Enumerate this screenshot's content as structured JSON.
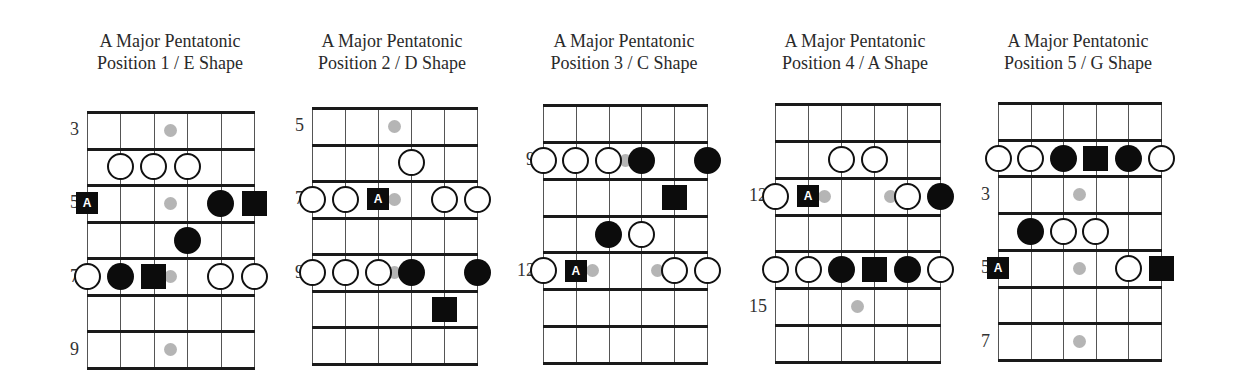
{
  "diagrams": [
    {
      "title_line1": "A Major Pentatonic",
      "title_line2": "Position 1 / E Shape",
      "title_center_x": 170,
      "grid": {
        "left": 87,
        "top": 112,
        "right": 254,
        "bottom": 368
      },
      "fret_labels": [
        {
          "row": 0,
          "label": "3"
        },
        {
          "row": 2,
          "label": "5"
        },
        {
          "row": 4,
          "label": "7"
        },
        {
          "row": 6,
          "label": "9"
        }
      ],
      "markers": [
        {
          "row": 0,
          "string": 2.5,
          "type": "inlay"
        },
        {
          "row": 1,
          "string": 1,
          "type": "open"
        },
        {
          "row": 1,
          "string": 2,
          "type": "open"
        },
        {
          "row": 1,
          "string": 3,
          "type": "open"
        },
        {
          "row": 2,
          "string": 2.5,
          "type": "inlay"
        },
        {
          "row": 2,
          "string": 0,
          "type": "root",
          "label": "A"
        },
        {
          "row": 2,
          "string": 4,
          "type": "filled"
        },
        {
          "row": 2,
          "string": 5,
          "type": "square"
        },
        {
          "row": 3,
          "string": 3,
          "type": "filled"
        },
        {
          "row": 4,
          "string": 2.5,
          "type": "inlay"
        },
        {
          "row": 4,
          "string": 0,
          "type": "open"
        },
        {
          "row": 4,
          "string": 1,
          "type": "filled"
        },
        {
          "row": 4,
          "string": 2,
          "type": "square"
        },
        {
          "row": 4,
          "string": 4,
          "type": "open"
        },
        {
          "row": 4,
          "string": 5,
          "type": "open"
        },
        {
          "row": 6,
          "string": 2.5,
          "type": "inlay"
        }
      ]
    },
    {
      "title_line1": "A Major Pentatonic",
      "title_line2": "Position 2 / D Shape",
      "title_center_x": 392,
      "grid": {
        "left": 312,
        "top": 108,
        "right": 477,
        "bottom": 364
      },
      "fret_labels": [
        {
          "row": 0,
          "label": "5"
        },
        {
          "row": 2,
          "label": "7"
        },
        {
          "row": 4,
          "label": "9"
        }
      ],
      "markers": [
        {
          "row": 0,
          "string": 2.5,
          "type": "inlay"
        },
        {
          "row": 1,
          "string": 3,
          "type": "open"
        },
        {
          "row": 2,
          "string": 2.5,
          "type": "inlay"
        },
        {
          "row": 2,
          "string": 0,
          "type": "open"
        },
        {
          "row": 2,
          "string": 1,
          "type": "open"
        },
        {
          "row": 2,
          "string": 2,
          "type": "root",
          "label": "A"
        },
        {
          "row": 2,
          "string": 4,
          "type": "open"
        },
        {
          "row": 2,
          "string": 5,
          "type": "open"
        },
        {
          "row": 4,
          "string": 2.5,
          "type": "inlay"
        },
        {
          "row": 4,
          "string": 0,
          "type": "open"
        },
        {
          "row": 4,
          "string": 1,
          "type": "open"
        },
        {
          "row": 4,
          "string": 2,
          "type": "open"
        },
        {
          "row": 4,
          "string": 3,
          "type": "filled"
        },
        {
          "row": 4,
          "string": 5,
          "type": "filled"
        },
        {
          "row": 5,
          "string": 4,
          "type": "square"
        }
      ]
    },
    {
      "title_line1": "A Major Pentatonic",
      "title_line2": "Position 3 / C Shape",
      "title_center_x": 624,
      "grid": {
        "left": 543,
        "top": 105,
        "right": 707,
        "bottom": 363
      },
      "fret_labels": [
        {
          "row": 1,
          "label": "9"
        },
        {
          "row": 4,
          "label": "12"
        }
      ],
      "markers": [
        {
          "row": 1,
          "string": 2.5,
          "type": "inlay"
        },
        {
          "row": 1,
          "string": 0,
          "type": "open"
        },
        {
          "row": 1,
          "string": 1,
          "type": "open"
        },
        {
          "row": 1,
          "string": 2,
          "type": "open"
        },
        {
          "row": 1,
          "string": 3,
          "type": "filled"
        },
        {
          "row": 1,
          "string": 5,
          "type": "filled"
        },
        {
          "row": 2,
          "string": 4,
          "type": "square"
        },
        {
          "row": 3,
          "string": 2,
          "type": "filled"
        },
        {
          "row": 3,
          "string": 3,
          "type": "open"
        },
        {
          "row": 4,
          "string": 1.5,
          "type": "inlay"
        },
        {
          "row": 4,
          "string": 3.5,
          "type": "inlay"
        },
        {
          "row": 4,
          "string": 0,
          "type": "open"
        },
        {
          "row": 4,
          "string": 1,
          "type": "root",
          "label": "A"
        },
        {
          "row": 4,
          "string": 4,
          "type": "open"
        },
        {
          "row": 4,
          "string": 5,
          "type": "open"
        }
      ]
    },
    {
      "title_line1": "A Major Pentatonic",
      "title_line2": "Position 4 / A Shape",
      "title_center_x": 855,
      "grid": {
        "left": 775,
        "top": 104,
        "right": 940,
        "bottom": 362
      },
      "fret_labels": [
        {
          "row": 2,
          "label": "12"
        },
        {
          "row": 5,
          "label": "15"
        }
      ],
      "markers": [
        {
          "row": 1,
          "string": 2,
          "type": "open"
        },
        {
          "row": 1,
          "string": 3,
          "type": "open"
        },
        {
          "row": 2,
          "string": 1.5,
          "type": "inlay"
        },
        {
          "row": 2,
          "string": 3.5,
          "type": "inlay"
        },
        {
          "row": 2,
          "string": 0,
          "type": "open"
        },
        {
          "row": 2,
          "string": 1,
          "type": "root",
          "label": "A"
        },
        {
          "row": 2,
          "string": 4,
          "type": "open"
        },
        {
          "row": 2,
          "string": 5,
          "type": "filled"
        },
        {
          "row": 4,
          "string": 0,
          "type": "open"
        },
        {
          "row": 4,
          "string": 1,
          "type": "open"
        },
        {
          "row": 4,
          "string": 2,
          "type": "filled"
        },
        {
          "row": 4,
          "string": 3,
          "type": "square"
        },
        {
          "row": 4,
          "string": 4,
          "type": "filled"
        },
        {
          "row": 4,
          "string": 5,
          "type": "open"
        },
        {
          "row": 5,
          "string": 2.5,
          "type": "inlay"
        }
      ]
    },
    {
      "title_line1": "A Major Pentatonic",
      "title_line2": "Position 5 / G Shape",
      "title_center_x": 1078,
      "grid": {
        "left": 998,
        "top": 103,
        "right": 1161,
        "bottom": 360
      },
      "fret_labels": [
        {
          "row": 2,
          "label": "3"
        },
        {
          "row": 4,
          "label": "5"
        },
        {
          "row": 6,
          "label": "7"
        }
      ],
      "markers": [
        {
          "row": 1,
          "string": 0,
          "type": "open"
        },
        {
          "row": 1,
          "string": 1,
          "type": "open"
        },
        {
          "row": 1,
          "string": 2,
          "type": "filled"
        },
        {
          "row": 1,
          "string": 3,
          "type": "square"
        },
        {
          "row": 1,
          "string": 4,
          "type": "filled"
        },
        {
          "row": 1,
          "string": 5,
          "type": "open"
        },
        {
          "row": 2,
          "string": 2.5,
          "type": "inlay"
        },
        {
          "row": 3,
          "string": 1,
          "type": "filled"
        },
        {
          "row": 3,
          "string": 2,
          "type": "open"
        },
        {
          "row": 3,
          "string": 3,
          "type": "open"
        },
        {
          "row": 4,
          "string": 2.5,
          "type": "inlay"
        },
        {
          "row": 4,
          "string": 0,
          "type": "root",
          "label": "A"
        },
        {
          "row": 4,
          "string": 4,
          "type": "open"
        },
        {
          "row": 4,
          "string": 5,
          "type": "square"
        },
        {
          "row": 6,
          "string": 2.5,
          "type": "inlay"
        }
      ]
    }
  ],
  "legend_inferred": {
    "open": "scale tone",
    "filled": "chord tone",
    "square": "chord root",
    "root": "scale root A"
  }
}
